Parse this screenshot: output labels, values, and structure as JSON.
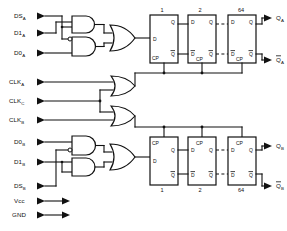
{
  "diagram": {
    "type": "logic-schematic",
    "line_color": "#111111",
    "background": "#ffffff"
  },
  "inputs": [
    {
      "id": "dsa",
      "base": "DS",
      "sub": "A",
      "label": "DSA",
      "y": 16
    },
    {
      "id": "d1a",
      "base": "D1",
      "sub": "A",
      "label": "D1A",
      "y": 33
    },
    {
      "id": "d0a",
      "base": "D0",
      "sub": "A",
      "label": "D0A",
      "y": 53
    },
    {
      "id": "clka",
      "base": "CLK",
      "sub": "A",
      "label": "CLKA",
      "y": 82
    },
    {
      "id": "clkc",
      "base": "CLK",
      "sub": "C",
      "label": "CLKC",
      "y": 101
    },
    {
      "id": "clkb",
      "base": "CLK",
      "sub": "B",
      "label": "CLKB",
      "y": 120
    },
    {
      "id": "d0b",
      "base": "D0",
      "sub": "B",
      "label": "D0B",
      "y": 142
    },
    {
      "id": "d1b",
      "base": "D1",
      "sub": "B",
      "label": "D1B",
      "y": 162
    },
    {
      "id": "dsb",
      "base": "DS",
      "sub": "B",
      "label": "DSB",
      "y": 186
    }
  ],
  "power": [
    {
      "id": "vcc",
      "base": "Vcc",
      "sub": "",
      "label": "Vcc",
      "y": 201
    },
    {
      "id": "gnd",
      "base": "GND",
      "sub": "",
      "label": "GND",
      "y": 215
    }
  ],
  "outputs": [
    {
      "id": "qa",
      "base": "Q",
      "sub": "A",
      "label": "QA",
      "overbar": false,
      "y": 18
    },
    {
      "id": "qa_bar",
      "base": "Q",
      "sub": "A",
      "label": "QA",
      "overbar": true,
      "y": 60
    },
    {
      "id": "qb",
      "base": "Q",
      "sub": "B",
      "label": "QB",
      "overbar": false,
      "y": 146
    },
    {
      "id": "qb_bar",
      "base": "Q",
      "sub": "B",
      "label": "QB",
      "overbar": true,
      "y": 186
    }
  ],
  "stages": {
    "top": [
      {
        "num": "1",
        "x": 150
      },
      {
        "num": "2",
        "x": 188
      },
      {
        "num": "64",
        "x": 228
      }
    ],
    "bottom": [
      {
        "num": "1",
        "x": 150
      },
      {
        "num": "2",
        "x": 188
      },
      {
        "num": "64",
        "x": 228
      }
    ]
  },
  "pins": {
    "d": "D",
    "d_bar": "D",
    "q": "Q",
    "q_bar": "Q",
    "cp": "CP"
  },
  "gates": {
    "top_and_1": {
      "type": "AND",
      "inverted_input": false
    },
    "top_and_2": {
      "type": "AND",
      "inverted_input": true
    },
    "top_or": {
      "type": "OR"
    },
    "clk_or_a": {
      "type": "OR"
    },
    "clk_or_b": {
      "type": "OR"
    },
    "bot_and_1": {
      "type": "AND",
      "inverted_input": true
    },
    "bot_and_2": {
      "type": "AND",
      "inverted_input": false
    },
    "bot_or": {
      "type": "OR"
    }
  }
}
